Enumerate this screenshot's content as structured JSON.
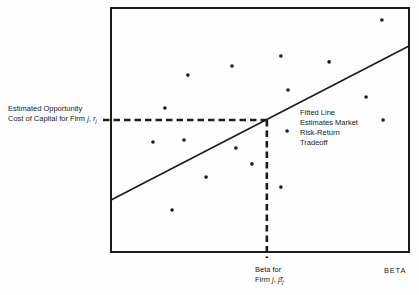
{
  "figure": {
    "background": "#fefefe",
    "ink": "#1b1b1b"
  },
  "y_axis_label": {
    "line1": "Estimated Opportunity",
    "line2_prefix": "Cost of Capital for Firm ",
    "firm_var": "j",
    "separator": ", ",
    "rate_var": "r",
    "rate_sub": "j"
  },
  "annotation": {
    "line1": "Fitted Line",
    "line2": "Estimates Market",
    "line3": "Risk-Return",
    "line4": "Tradeoff"
  },
  "x_marker_label": {
    "line1": "Beta for",
    "line2_prefix": "Firm ",
    "firm_var": "j",
    "separator": ", ",
    "beta_var": "β̂",
    "beta_sub": "j"
  },
  "x_axis_label": "BETA",
  "chart_data": {
    "type": "scatter",
    "title": "",
    "xlabel": "BETA",
    "ylabel": "Estimated Opportunity Cost of Capital for Firm j, rj",
    "axis_numeric_labels": false,
    "grid": false,
    "points": [
      {
        "x": 0.181,
        "y": 0.59
      },
      {
        "x": 0.258,
        "y": 0.725
      },
      {
        "x": 0.406,
        "y": 0.762
      },
      {
        "x": 0.57,
        "y": 0.803
      },
      {
        "x": 0.732,
        "y": 0.779
      },
      {
        "x": 0.909,
        "y": 0.951
      },
      {
        "x": 0.594,
        "y": 0.664
      },
      {
        "x": 0.856,
        "y": 0.635
      },
      {
        "x": 0.913,
        "y": 0.541
      },
      {
        "x": 0.141,
        "y": 0.451
      },
      {
        "x": 0.245,
        "y": 0.459
      },
      {
        "x": 0.419,
        "y": 0.426
      },
      {
        "x": 0.473,
        "y": 0.361
      },
      {
        "x": 0.319,
        "y": 0.307
      },
      {
        "x": 0.205,
        "y": 0.172
      },
      {
        "x": 0.591,
        "y": 0.496
      },
      {
        "x": 0.57,
        "y": 0.266
      }
    ],
    "fitted_line": {
      "x1": 0.0,
      "y1": 0.213,
      "x2": 1.0,
      "y2": 0.844
    },
    "marked_point": {
      "x": 0.523,
      "y": 0.541
    }
  }
}
